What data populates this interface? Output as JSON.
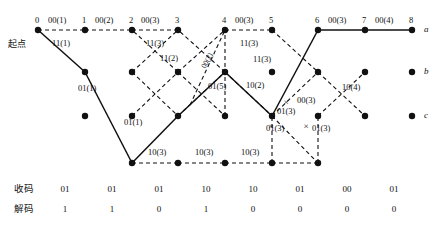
{
  "figure": {
    "type": "viterbi-trellis",
    "start_label": "起点",
    "state_labels": [
      "a",
      "b",
      "c"
    ],
    "time_indices": [
      "0",
      "1",
      "2",
      "3",
      "4",
      "5",
      "6",
      "7",
      "8"
    ],
    "error_marks": [
      "×",
      "×",
      "×"
    ]
  },
  "branch_labels": {
    "top_row": [
      {
        "text": "00(1)"
      },
      {
        "text": "00(2)"
      },
      {
        "text": "00(3)"
      },
      {
        "text": "00(3)"
      },
      {
        "text": "00(3)"
      },
      {
        "text": "00(4)"
      }
    ],
    "second_row": [
      {
        "text": "11(1)"
      },
      {
        "text": "11(3)"
      },
      {
        "text": "11(3)"
      }
    ],
    "middle": [
      {
        "text": "11(2)"
      },
      {
        "text": "00(2)"
      },
      {
        "text": "01(5)"
      },
      {
        "text": "10(2)"
      },
      {
        "text": "11(3)"
      },
      {
        "text": "00(3)"
      },
      {
        "text": "10(4)"
      }
    ],
    "lower": [
      {
        "text": "01(1)"
      },
      {
        "text": "01(1)"
      },
      {
        "text": "01(3)"
      },
      {
        "text": "01(3)"
      },
      {
        "text": "01(3)"
      }
    ],
    "bottom_row": [
      {
        "text": "10(3)"
      },
      {
        "text": "10(3)"
      },
      {
        "text": "10(3)"
      }
    ]
  },
  "table": {
    "rows": [
      {
        "label": "收码",
        "values": [
          "01",
          "01",
          "01",
          "10",
          "10",
          "01",
          "00",
          "01"
        ]
      },
      {
        "label": "解码",
        "values": [
          "1",
          "1",
          "0",
          "1",
          "0",
          "0",
          "0",
          "0"
        ]
      }
    ]
  },
  "colors": {
    "ink": "#111111",
    "background": "#ffffff"
  }
}
